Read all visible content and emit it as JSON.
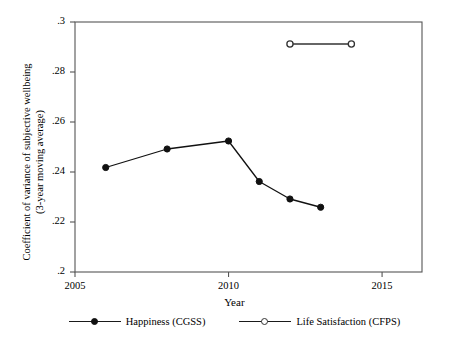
{
  "chart_data": {
    "type": "line",
    "title": "",
    "xlabel": "Year",
    "ylabel_line1": "Coefficient of variance of subjective wellbeing",
    "ylabel_line2": "(3-year moving average)",
    "xlim": [
      2005,
      2016.3
    ],
    "ylim": [
      0.2,
      0.3
    ],
    "grid": false,
    "legend_position": "bottom",
    "xticks": [
      2005,
      2010,
      2015
    ],
    "xtick_labels": [
      "2005",
      "2010",
      "2015"
    ],
    "yticks": [
      0.2,
      0.22,
      0.24,
      0.26,
      0.28,
      0.3
    ],
    "ytick_labels": [
      ".2",
      ".22",
      ".24",
      ".26",
      ".28",
      ".3"
    ],
    "series": [
      {
        "name": "Happiness (CGSS)",
        "marker": "filled-circle",
        "color": "#111111",
        "x": [
          2006,
          2008,
          2010,
          2011,
          2012,
          2013
        ],
        "values": [
          0.2418,
          0.2492,
          0.2524,
          0.2362,
          0.2292,
          0.2259
        ]
      },
      {
        "name": "Life Satisfaction (CFPS)",
        "marker": "hollow-circle",
        "color": "#333333",
        "x": [
          2012,
          2014
        ],
        "values": [
          0.2912,
          0.2912
        ]
      }
    ]
  },
  "legend": {
    "entries": [
      {
        "label": "Happiness (CGSS)",
        "marker": "filled-circle"
      },
      {
        "label": "Life Satisfaction (CFPS)",
        "marker": "hollow-circle"
      }
    ]
  }
}
